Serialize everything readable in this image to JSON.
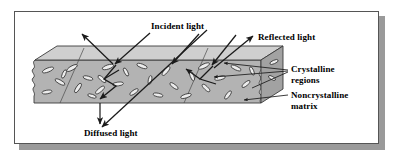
{
  "figure": {
    "type": "schematic-diagram",
    "background_color": "#ffffff",
    "frame": {
      "border_color": "#555555",
      "shadow_color": "#9a9a9a",
      "fill_color": "#ffffff"
    },
    "slab": {
      "name": "polymer-slab",
      "fill_color": "#b3b3b3",
      "edge_color": "#333333",
      "top_face_color": "#c9c9c9",
      "left_edge_style": "torn-wavy",
      "right_edge_style": "torn-wavy"
    },
    "crystallite": {
      "fill_color": "#e8e8e8",
      "stroke_color": "#2a2a2a",
      "shape": "elongated-lens"
    },
    "arrow_color": "#1a1a1a"
  },
  "labels": {
    "incident_light": "Incident light",
    "reflected_light": "Reflected light",
    "crystalline_regions_line1": "Crystalline",
    "crystalline_regions_line2": "regions",
    "noncrystalline_matrix_line1": "Noncrystalline",
    "noncrystalline_matrix_line2": "matrix",
    "diffused_light": "Diffused light"
  },
  "annotations": {
    "incident_ray_count": 3,
    "reflected_ray_count": 2,
    "diffused_ray_count": 2,
    "transmitted_ray_count": 1,
    "crystalline_leader_count": 3,
    "noncrystalline_leader_count": 1
  }
}
